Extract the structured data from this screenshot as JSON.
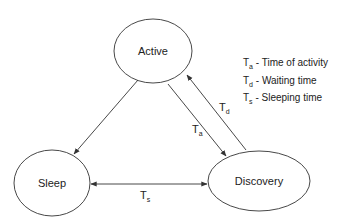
{
  "diagram": {
    "type": "state-diagram",
    "states": [
      {
        "id": "active",
        "label": "Active"
      },
      {
        "id": "sleep",
        "label": "Sleep"
      },
      {
        "id": "discovery",
        "label": "Discovery"
      }
    ],
    "transitions": [
      {
        "from": "active",
        "to": "sleep",
        "label": ""
      },
      {
        "from": "active",
        "to": "discovery",
        "label_main": "T",
        "label_sub": "a"
      },
      {
        "from": "discovery",
        "to": "active",
        "label_main": "T",
        "label_sub": "d"
      },
      {
        "from": "sleep",
        "to": "discovery",
        "bidirectional": true,
        "label_main": "T",
        "label_sub": "s"
      }
    ],
    "legend": [
      {
        "symbol_main": "T",
        "symbol_sub": "a",
        "text": " - Time of activity"
      },
      {
        "symbol_main": "T",
        "symbol_sub": "d",
        "text": " - Waiting time"
      },
      {
        "symbol_main": "T",
        "symbol_sub": "s",
        "text": " - Sleeping time"
      }
    ],
    "colors": {
      "stroke": "#333333",
      "text": "#222222",
      "background": "#ffffff"
    }
  }
}
